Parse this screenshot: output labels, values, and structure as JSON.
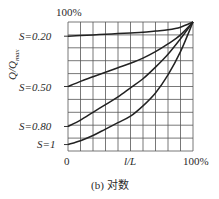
{
  "chart_data": {
    "type": "line",
    "title": "",
    "caption": "(b) 对数",
    "xlabel": "l/L",
    "ylabel": "Q/Q_max",
    "x_tick_labels": [
      "0",
      "100%"
    ],
    "y_tick_labels": [
      "100%"
    ],
    "grid": true,
    "grid_divisions": {
      "x": 10,
      "y": 10
    },
    "xlim": [
      0,
      1
    ],
    "ylim": [
      0,
      1
    ],
    "x": [
      0,
      0.1,
      0.2,
      0.3,
      0.4,
      0.5,
      0.6,
      0.7,
      0.8,
      0.9,
      1.0
    ],
    "series": [
      {
        "name": "S=0.20",
        "values": [
          0.89,
          0.895,
          0.9,
          0.905,
          0.91,
          0.915,
          0.92,
          0.93,
          0.94,
          0.96,
          1.0
        ]
      },
      {
        "name": "S=0.50",
        "values": [
          0.5,
          0.54,
          0.575,
          0.61,
          0.645,
          0.68,
          0.72,
          0.77,
          0.83,
          0.9,
          1.0
        ]
      },
      {
        "name": "S=0.80",
        "values": [
          0.19,
          0.24,
          0.3,
          0.36,
          0.42,
          0.49,
          0.56,
          0.65,
          0.75,
          0.87,
          1.0
        ]
      },
      {
        "name": "S=1",
        "values": [
          0.05,
          0.08,
          0.12,
          0.17,
          0.22,
          0.27,
          0.35,
          0.45,
          0.59,
          0.77,
          1.0
        ]
      }
    ]
  },
  "labels": {
    "top": "100%",
    "right": "100%",
    "origin": "0",
    "xlabel": "l/L",
    "ylabel_main": "Q/Q",
    "ylabel_sub": "max",
    "caption": "(b) 对数",
    "series_labels": [
      "S=0.20",
      "S=0.50",
      "S=0.80",
      "S=1"
    ]
  }
}
